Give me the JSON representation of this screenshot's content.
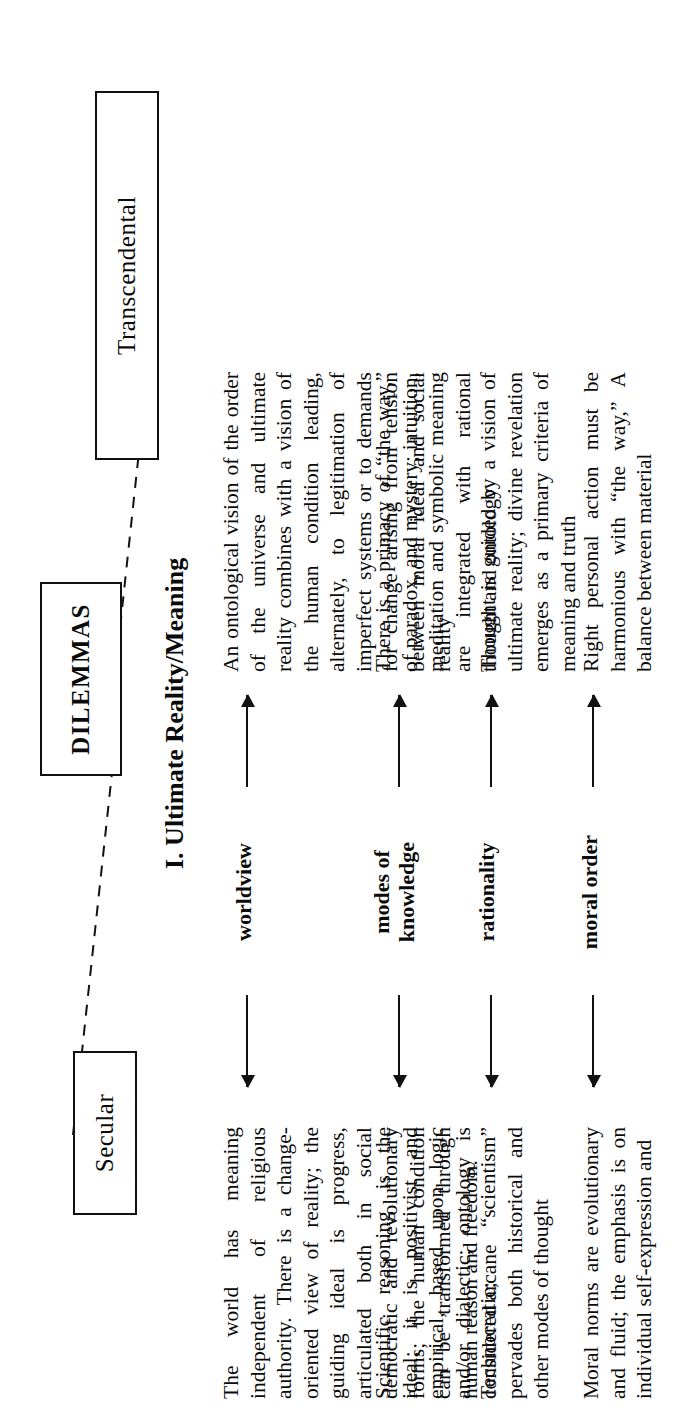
{
  "diagram": {
    "title_box": "DILEMMAS",
    "left_pole": "Secular",
    "right_pole": "Transcendental",
    "section_heading": "I. Ultimate Reality/Meaning"
  },
  "rows": [
    {
      "label": "worldview",
      "label_lines": [
        "worldview"
      ],
      "secular": "The world has meaning independent of religious authority. There is a change-oriented view of reality; the guiding ideal is progress, articulated both in social democratic and revolutionary forms; the human condition can be transformed through human reason and freedom.",
      "transcendental": "An ontological vision of the order of the universe and ultimate reality combines with a vision of the human condition leading, alternately, to legitimation of imperfect systems or to demands for change arising from tension between moral ideal and social reality"
    },
    {
      "label": "modes of knowledge",
      "label_lines": [
        "modes of",
        "knowledge"
      ],
      "secular": "Scientific reasoning is the ideal; it is positivist and empirical, based upon logic and/or dialectic; ontology is considered arcane",
      "transcendental": "There is a primacy of “the way,” of paradox, and mystery; intuition, meditation and symbolic meaning are integrated with rational thought and ontology"
    },
    {
      "label": "rationality",
      "label_lines": [
        "rationality"
      ],
      "secular": "Technocratic; “scientism” pervades both historical and other modes of thought",
      "transcendental": "Thought is guided by a vision of ultimate reality; divine revelation emerges as a primary criteria of meaning and truth"
    },
    {
      "label": "moral order",
      "label_lines": [
        "moral order"
      ],
      "secular": "Moral norms are evolutionary and fluid; the emphasis is on individual self-expression and",
      "transcendental": "Right personal action must be harmonious with “the way,” A balance between material"
    }
  ],
  "icons": {
    "arrow_left": "left-arrow-icon",
    "arrow_right": "right-arrow-icon",
    "connector": "dashed-connector-line"
  },
  "colors": {
    "ink": "#0a0a0a",
    "paper": "#ffffff"
  }
}
